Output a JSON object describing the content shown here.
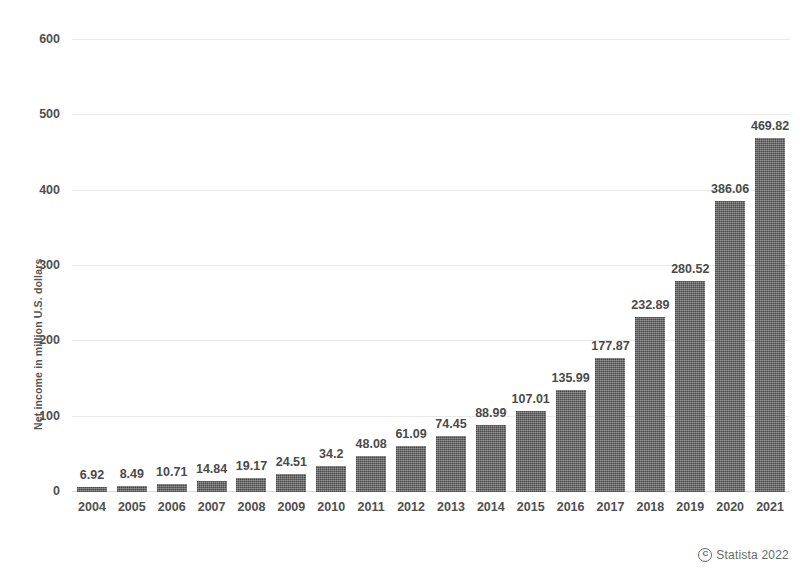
{
  "chart_data": {
    "type": "bar",
    "title": "",
    "subtitle": "",
    "xlabel": "",
    "ylabel": "Net income in million U.S. dollars",
    "categories": [
      "2004",
      "2005",
      "2006",
      "2007",
      "2008",
      "2009",
      "2010",
      "2011",
      "2012",
      "2013",
      "2014",
      "2015",
      "2016",
      "2017",
      "2018",
      "2019",
      "2020",
      "2021"
    ],
    "values": [
      6.92,
      8.49,
      10.71,
      14.84,
      19.17,
      24.51,
      34.2,
      48.08,
      61.09,
      74.45,
      88.99,
      107.01,
      135.99,
      177.87,
      232.89,
      280.52,
      386.06,
      469.82
    ],
    "value_labels": [
      "6.92",
      "8.49",
      "10.71",
      "14.84",
      "19.17",
      "24.51",
      "34.2",
      "48.08",
      "61.09",
      "74.45",
      "88.99",
      "107.01",
      "135.99",
      "177.87",
      "232.89",
      "280.52",
      "386.06",
      "469.82"
    ],
    "ylim": [
      0,
      600
    ],
    "yticks": [
      0,
      100,
      200,
      300,
      400,
      500,
      600
    ],
    "ytick_labels": [
      "0",
      "100",
      "200",
      "300",
      "400",
      "500",
      "600"
    ],
    "grid": true,
    "grid_axis": "y",
    "legend": false,
    "bar_color": "#6b6b6b",
    "grid_color": "#e9e9e9",
    "text_color": "#4a4a4a"
  },
  "footer": {
    "copyright_mark": "C",
    "text": "Statista 2022"
  }
}
